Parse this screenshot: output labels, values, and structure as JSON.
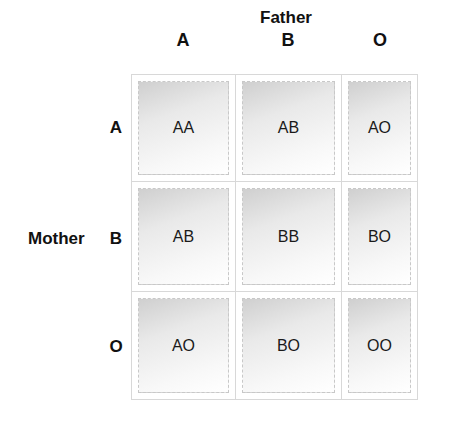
{
  "title": "Father",
  "columns": [
    "A",
    "B",
    "O"
  ],
  "row_header": "Mother",
  "rows": [
    {
      "label": "A",
      "cells": [
        "AA",
        "AB",
        "AO"
      ]
    },
    {
      "label": "B",
      "cells": [
        "AB",
        "BB",
        "BO"
      ]
    },
    {
      "label": "O",
      "cells": [
        "AO",
        "BO",
        "OO"
      ]
    }
  ]
}
